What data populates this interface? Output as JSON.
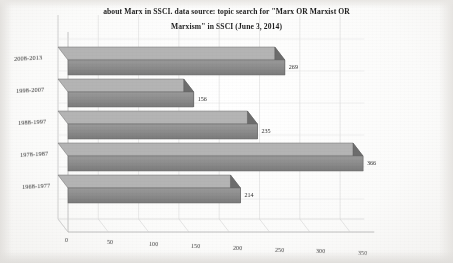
{
  "chart_data": {
    "type": "bar",
    "orientation": "horizontal",
    "title": "about Marx in SSCI. data source: topic search for \"Marx OR Marxist OR Marxism\" in SSCI (June 3, 2014)",
    "title_line1": "about Marx in SSCI. data source: topic search for \"Marx OR Marxist OR",
    "title_line2": "Marxism\" in SSCI (June 3, 2014)",
    "subtitle": "",
    "xlabel": "",
    "ylabel": "",
    "categories": [
      "2008-2013",
      "1998-2007",
      "1988-1997",
      "1978-1987",
      "1968-1977"
    ],
    "values": [
      269,
      156,
      235,
      366,
      214
    ],
    "value_labels": [
      "269",
      "156",
      "235",
      "366",
      "214"
    ],
    "xticks": [
      0,
      50,
      100,
      150,
      200,
      250,
      300,
      350
    ],
    "xtick_labels": [
      "0",
      "50",
      "100",
      "150",
      "200",
      "250",
      "300",
      "350"
    ],
    "xlim": [
      0,
      380
    ],
    "grid": true,
    "legend": false,
    "legend_position": "none",
    "style": "3d-bar",
    "bar_color": "#8a8a8a",
    "bar_top_color": "#b4b4b4",
    "bar_side_color": "#6d6d6d",
    "background_color": "#ffffff",
    "axis_color": "#9a9a9a",
    "grid_color": "#cfcfcf",
    "text_color": "#2b2b2b"
  }
}
